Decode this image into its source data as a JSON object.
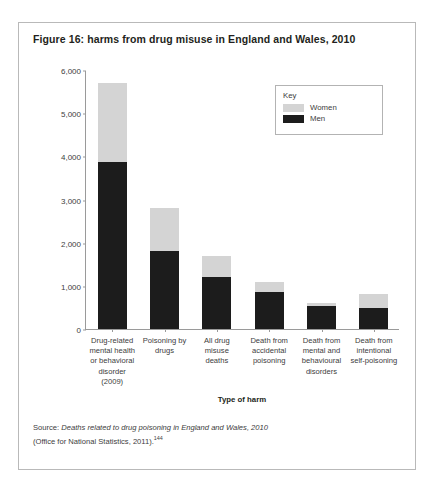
{
  "figure": {
    "title": "Figure 16: harms from drug misuse in England and Wales, 2010",
    "source_prefix": "Source: ",
    "source_italic": "Deaths related to drug poisoning in England and Wales, 2010",
    "source_line2": "(Office for National Statistics, 2011).",
    "source_footnote": "144"
  },
  "legend": {
    "title": "Key",
    "entries": [
      {
        "label": "Women",
        "color": "#d4d4d4"
      },
      {
        "label": "Men",
        "color": "#1c1c1c"
      }
    ]
  },
  "chart_data": {
    "type": "bar",
    "subtype": "stacked-vertical",
    "title": "Figure 16: harms from drug misuse in England and Wales, 2010",
    "xlabel": "Type of harm",
    "ylabel": "Number of individuals",
    "ylim": [
      0,
      6000
    ],
    "yticks": [
      0,
      1000,
      2000,
      3000,
      4000,
      5000,
      6000
    ],
    "ytick_labels": [
      "0",
      "1,000",
      "2,000",
      "3,000",
      "4,000",
      "5,000",
      "6,000"
    ],
    "grid": false,
    "legend_position": "top-right",
    "categories": [
      "Drug-related mental health or behavioral disorder (2009)",
      "Poisoning by drugs",
      "All drug misuse deaths",
      "Death from accidental poisoning",
      "Death from mental and behavioural disorders",
      "Death from intentional self-poisoning"
    ],
    "category_lines": [
      [
        "Drug-related",
        "mental health",
        "or behavioral",
        "disorder",
        "(2009)"
      ],
      [
        "Poisoning by",
        "drugs"
      ],
      [
        "All drug",
        "misuse",
        "deaths"
      ],
      [
        "Death from",
        "accidental",
        "poisoning"
      ],
      [
        "Death from",
        "mental and",
        "behavioural",
        "disorders"
      ],
      [
        "Death from",
        "intentional",
        "self-poisoning"
      ]
    ],
    "series": [
      {
        "name": "Men",
        "color": "#1c1c1c",
        "values": [
          3880,
          1800,
          1200,
          860,
          540,
          480
        ]
      },
      {
        "name": "Women",
        "color": "#d4d4d4",
        "values": [
          1820,
          1000,
          480,
          230,
          70,
          320
        ]
      }
    ],
    "totals": [
      5700,
      2800,
      1680,
      1090,
      610,
      800
    ]
  }
}
